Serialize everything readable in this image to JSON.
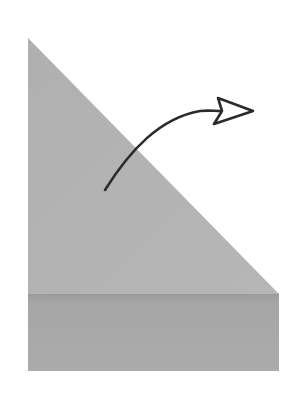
{
  "diagram": {
    "type": "fold-instruction",
    "colors": {
      "background": "#ffffff",
      "triangle_fill": "#b3b3b3",
      "base_fill": "#a9a9a9",
      "base_edge": "#999999",
      "arrow_stroke": "#2b2b2b",
      "arrow_head_fill": "#ffffff"
    },
    "shapes": {
      "triangle": {
        "points": [
          [
            28,
            38
          ],
          [
            28,
            294
          ],
          [
            279,
            294
          ]
        ]
      },
      "base": {
        "x": 28,
        "y": 294,
        "width": 251,
        "height": 77
      },
      "arrow": {
        "start": [
          105,
          190
        ],
        "end": [
          222,
          111
        ],
        "direction": "up-right",
        "head": "hollow"
      }
    }
  }
}
